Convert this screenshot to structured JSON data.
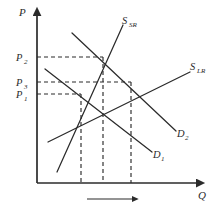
{
  "figure": {
    "background_color": "#ffffff",
    "ink_color": "#2b2b2b",
    "axes": {
      "y_axis_title": "P",
      "x_axis_title": "Q",
      "y_axis_name": "price-axis",
      "x_axis_name": "quantity-axis"
    },
    "price_ticks": [
      {
        "key": "p2",
        "label": "P",
        "subscript": "2",
        "y": 57
      },
      {
        "key": "p3",
        "label": "P",
        "subscript": "3",
        "y": 82
      },
      {
        "key": "p1",
        "label": "P",
        "subscript": "1",
        "y": 94
      }
    ],
    "curves": [
      {
        "key": "s_sr",
        "label": "S",
        "subscript": "SR",
        "kind": "supply-short-run",
        "label_x": 126,
        "label_y": 22
      },
      {
        "key": "s_lr",
        "label": "S",
        "subscript": "LR",
        "kind": "supply-long-run",
        "label_x": 194,
        "label_y": 68
      },
      {
        "key": "d1",
        "label": "D",
        "subscript": "1",
        "kind": "demand-initial",
        "label_x": 156,
        "label_y": 156
      },
      {
        "key": "d2",
        "label": "D",
        "subscript": "2",
        "kind": "demand-shifted",
        "label_x": 180,
        "label_y": 136
      }
    ],
    "equilibria": [
      {
        "key": "e1",
        "price_key": "p1",
        "x": 81,
        "y": 94
      },
      {
        "key": "e2",
        "price_key": "p2",
        "x": 103,
        "y": 57
      },
      {
        "key": "e3",
        "price_key": "p3",
        "x": 131,
        "y": 82
      }
    ],
    "shift_arrow": {
      "name": "demand-shift-arrow",
      "x_start": 87,
      "x_end": 137,
      "y": 199
    }
  }
}
